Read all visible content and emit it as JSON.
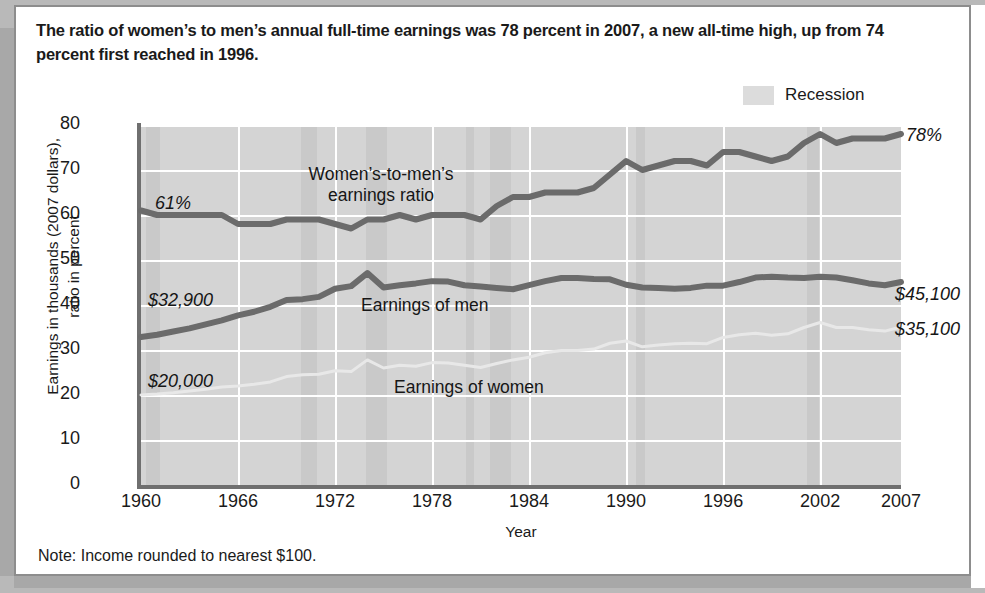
{
  "headline": "The ratio of women’s to men’s annual full-time earnings was 78 percent in 2007, a new all-time high, up from 74 percent first reached in 1996.",
  "note": "Note: Income rounded to nearest $100.",
  "legend": {
    "recession_label": "Recession",
    "recession_color": "#dcdcdc"
  },
  "axes": {
    "ylabel_line1": "Earnings in thousands (2007 dollars),",
    "ylabel_line2": "ratio in percent",
    "xlabel": "Year",
    "yticks": [
      "80",
      "70",
      "60",
      "50",
      "40",
      "30",
      "20",
      "10",
      "0"
    ],
    "xticks": [
      "1960",
      "1966",
      "1972",
      "1978",
      "1984",
      "1990",
      "1996",
      "2002",
      "2007"
    ]
  },
  "annotations": {
    "ratio_start": "61%",
    "ratio_end": "78%",
    "ratio_series_line1": "Women’s-to-men’s",
    "ratio_series_line2": "earnings ratio",
    "men_start": "$32,900",
    "men_end": "$45,100",
    "men_series": "Earnings of men",
    "women_start": "$20,000",
    "women_end": "$35,100",
    "women_series": "Earnings of women"
  },
  "colors": {
    "plot_background": "#d4d4d4",
    "recession_band": "#c5c5c5",
    "gridline": "#ffffff",
    "dark_series": "#6b6b6b",
    "light_series": "#e8e8e8",
    "axis": "#6f6f6f",
    "card_border": "#8d8d8d"
  },
  "chart_data": {
    "type": "line",
    "title": "The ratio of women’s to men’s annual full-time earnings was 78 percent in 2007, a new all-time high, up from 74 percent first reached in 1996.",
    "xlabel": "Year",
    "ylabel": "Earnings in thousands (2007 dollars), ratio in percent",
    "xlim": [
      1960,
      2007
    ],
    "ylim": [
      0,
      80
    ],
    "ytick_step": 10,
    "grid": true,
    "legend_position": "top-right",
    "legend_entries": [
      "Recession"
    ],
    "x": [
      1960,
      1961,
      1962,
      1963,
      1964,
      1965,
      1966,
      1967,
      1968,
      1969,
      1970,
      1971,
      1972,
      1973,
      1974,
      1975,
      1976,
      1977,
      1978,
      1979,
      1980,
      1981,
      1982,
      1983,
      1984,
      1985,
      1986,
      1987,
      1988,
      1989,
      1990,
      1991,
      1992,
      1993,
      1994,
      1995,
      1996,
      1997,
      1998,
      1999,
      2000,
      2001,
      2002,
      2003,
      2004,
      2005,
      2006,
      2007
    ],
    "series": [
      {
        "name": "Women’s-to-men’s earnings ratio",
        "unit": "percent",
        "color": "#6b6b6b",
        "style": "thick",
        "start_label": "61%",
        "end_label": "78%",
        "values": [
          61,
          60,
          60,
          60,
          60,
          60,
          58,
          58,
          58,
          59,
          59,
          59,
          58,
          57,
          59,
          59,
          60,
          59,
          60,
          60,
          60,
          59,
          62,
          64,
          64,
          65,
          65,
          65,
          66,
          69,
          72,
          70,
          71,
          72,
          72,
          71,
          74,
          74,
          73,
          72,
          73,
          76,
          78,
          76,
          77,
          77,
          77,
          78
        ]
      },
      {
        "name": "Earnings of men",
        "unit": "thousands of 2007 dollars",
        "color": "#6b6b6b",
        "style": "thick",
        "start_label": "$32,900",
        "end_label": "$45,100",
        "values": [
          32.9,
          33.4,
          34.1,
          34.8,
          35.7,
          36.6,
          37.7,
          38.5,
          39.6,
          41.1,
          41.3,
          41.8,
          43.6,
          44.2,
          47.1,
          43.9,
          44.4,
          44.8,
          45.3,
          45.2,
          44.4,
          44.1,
          43.8,
          43.5,
          44.4,
          45.3,
          46.0,
          46.0,
          45.8,
          45.7,
          44.5,
          43.9,
          43.8,
          43.6,
          43.8,
          44.3,
          44.3,
          45.1,
          46.1,
          46.3,
          46.1,
          46.0,
          46.3,
          46.1,
          45.5,
          44.8,
          44.4,
          45.1
        ]
      },
      {
        "name": "Earnings of women",
        "unit": "thousands of 2007 dollars",
        "color": "#e8e8e8",
        "style": "thin",
        "start_label": "$20,000",
        "end_label": "$35,100",
        "values": [
          20.0,
          20.2,
          20.5,
          20.9,
          21.3,
          21.8,
          22.0,
          22.4,
          22.9,
          24.1,
          24.5,
          24.6,
          25.4,
          25.2,
          27.8,
          26.0,
          26.6,
          26.4,
          27.2,
          27.1,
          26.6,
          26.1,
          27.0,
          27.8,
          28.4,
          29.4,
          29.9,
          29.9,
          30.2,
          31.5,
          32.0,
          30.7,
          31.1,
          31.4,
          31.5,
          31.4,
          32.8,
          33.4,
          33.7,
          33.3,
          33.6,
          35.0,
          36.1,
          35.0,
          35.0,
          34.5,
          34.2,
          35.1
        ]
      }
    ],
    "recession_bands": [
      [
        1960.3,
        1961.2
      ],
      [
        1969.9,
        1970.9
      ],
      [
        1973.9,
        1975.2
      ],
      [
        1980.1,
        1980.6
      ],
      [
        1981.6,
        1982.9
      ],
      [
        1990.6,
        1991.2
      ],
      [
        2001.2,
        2001.9
      ]
    ]
  }
}
